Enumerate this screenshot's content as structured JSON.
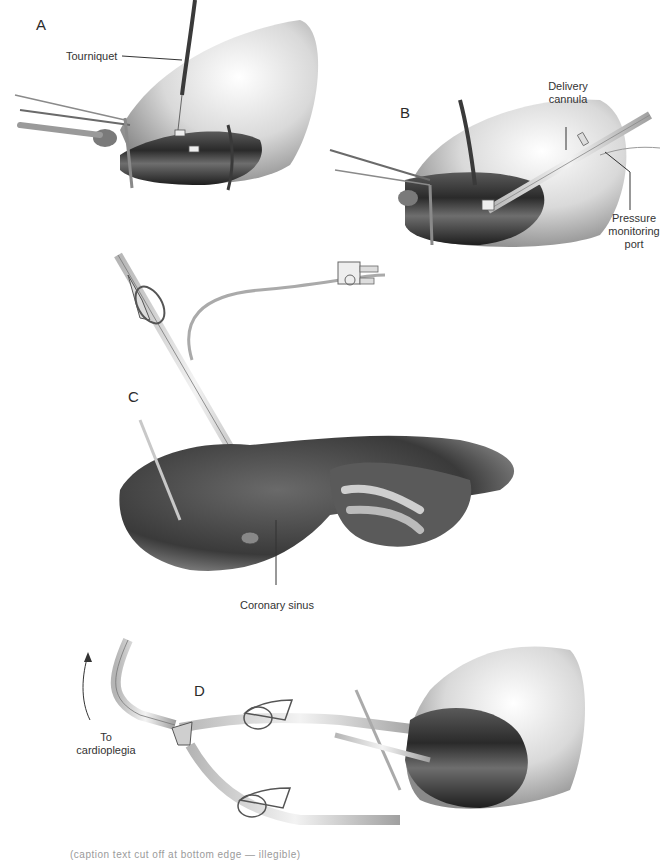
{
  "figure": {
    "panels": [
      {
        "id": "A",
        "letter": "A",
        "labels": [
          {
            "text": "Tourniquet"
          }
        ]
      },
      {
        "id": "B",
        "letter": "B",
        "labels": [
          {
            "text": "Delivery cannula"
          },
          {
            "text": "Pressure monitoring port"
          }
        ]
      },
      {
        "id": "C",
        "letter": "C",
        "labels": [
          {
            "text": "Coronary sinus"
          }
        ]
      },
      {
        "id": "D",
        "letter": "D",
        "labels": [
          {
            "text": "To cardioplegia"
          }
        ]
      }
    ],
    "labels": {
      "tourniquet": "Tourniquet",
      "delivery_line1": "Delivery",
      "delivery_line2": "cannula",
      "pressure_line1": "Pressure",
      "pressure_line2": "monitoring",
      "pressure_line3": "port",
      "coronary_sinus": "Coronary sinus",
      "to_line1": "To",
      "to_line2": "cardioplegia"
    },
    "caption": "(caption text cut off at bottom edge — illegible)",
    "colors": {
      "background": "#ffffff",
      "tissue_dark": "#2e2e2e",
      "tissue_mid": "#7a7a7a",
      "tissue_light": "#d8d8d8",
      "label_text": "#333333"
    }
  }
}
